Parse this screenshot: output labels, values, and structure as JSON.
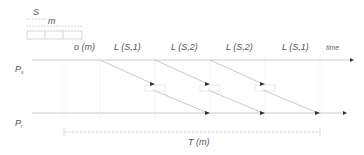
{
  "legend": {
    "s_label": "S",
    "m_label": "m"
  },
  "axes": {
    "sender_label": "P",
    "sender_sub": "s",
    "receiver_label": "P",
    "receiver_sub": "r",
    "time_label": "time"
  },
  "intervals": [
    {
      "label": "o (m)"
    },
    {
      "label": "L (S,1)"
    },
    {
      "label": "L (S,2)"
    },
    {
      "label": "L (S,2)"
    },
    {
      "label": "L (S,1)"
    }
  ],
  "total_label": "T (m)",
  "colors": {
    "line": "#bbbbbb",
    "text": "#555555",
    "arrow": "#333333"
  }
}
